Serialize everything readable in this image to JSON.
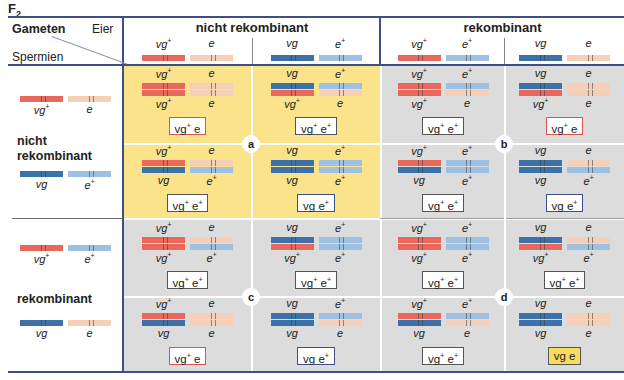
{
  "title": {
    "main": "F",
    "sub": "2"
  },
  "header": {
    "gameten": "Gameten",
    "eier": "Eier",
    "spermien": "Spermien",
    "groups": [
      {
        "label": "nicht rekombinant"
      },
      {
        "label": "rekombinant"
      }
    ],
    "egg_gametes": [
      {
        "a1": {
          "text": "vg",
          "sup": "+",
          "color": "vgp"
        },
        "a2": {
          "text": "e",
          "sup": "",
          "color": "e"
        }
      },
      {
        "a1": {
          "text": "vg",
          "sup": "",
          "color": "vg"
        },
        "a2": {
          "text": "e",
          "sup": "+",
          "color": "ep"
        }
      },
      {
        "a1": {
          "text": "vg",
          "sup": "+",
          "color": "vgp"
        },
        "a2": {
          "text": "e",
          "sup": "+",
          "color": "ep"
        }
      },
      {
        "a1": {
          "text": "vg",
          "sup": "",
          "color": "vg"
        },
        "a2": {
          "text": "e",
          "sup": "",
          "color": "e"
        }
      }
    ]
  },
  "rows": {
    "groups": [
      {
        "label_line1": "nicht",
        "label_line2": "rekombinant"
      },
      {
        "label_line1": "rekombinant",
        "label_line2": ""
      }
    ],
    "sperm_gametes": [
      {
        "a1": {
          "text": "vg",
          "sup": "+",
          "color": "vgp"
        },
        "a2": {
          "text": "e",
          "sup": "",
          "color": "e"
        }
      },
      {
        "a1": {
          "text": "vg",
          "sup": "",
          "color": "vg"
        },
        "a2": {
          "text": "e",
          "sup": "+",
          "color": "ep"
        }
      },
      {
        "a1": {
          "text": "vg",
          "sup": "+",
          "color": "vgp"
        },
        "a2": {
          "text": "e",
          "sup": "+",
          "color": "ep"
        }
      },
      {
        "a1": {
          "text": "vg",
          "sup": "",
          "color": "vg"
        },
        "a2": {
          "text": "e",
          "sup": "",
          "color": "e"
        }
      }
    ]
  },
  "quadrant_labels": [
    "a",
    "b",
    "c",
    "d"
  ],
  "cells": [
    [
      {
        "phenotype": {
          "p1": "vg",
          "s1": "+",
          "p2": "e",
          "s2": ""
        },
        "box": "red"
      },
      {
        "phenotype": {
          "p1": "vg",
          "s1": "+",
          "p2": "e",
          "s2": "+"
        },
        "box": "plain"
      },
      {
        "phenotype": {
          "p1": "vg",
          "s1": "+",
          "p2": "e",
          "s2": "+"
        },
        "box": "plain"
      },
      {
        "phenotype": {
          "p1": "vg",
          "s1": "+",
          "p2": "e",
          "s2": ""
        },
        "box": "red"
      }
    ],
    [
      {
        "phenotype": {
          "p1": "vg",
          "s1": "+",
          "p2": "e",
          "s2": "+"
        },
        "box": "plain"
      },
      {
        "phenotype": {
          "p1": "vg",
          "s1": "",
          "p2": "e",
          "s2": "+"
        },
        "box": "blue"
      },
      {
        "phenotype": {
          "p1": "vg",
          "s1": "+",
          "p2": "e",
          "s2": "+"
        },
        "box": "plain"
      },
      {
        "phenotype": {
          "p1": "vg",
          "s1": "",
          "p2": "e",
          "s2": "+"
        },
        "box": "blue"
      }
    ],
    [
      {
        "phenotype": {
          "p1": "vg",
          "s1": "+",
          "p2": "e",
          "s2": "+"
        },
        "box": "plain"
      },
      {
        "phenotype": {
          "p1": "vg",
          "s1": "+",
          "p2": "e",
          "s2": "+"
        },
        "box": "plain"
      },
      {
        "phenotype": {
          "p1": "vg",
          "s1": "+",
          "p2": "e",
          "s2": "+"
        },
        "box": "plain"
      },
      {
        "phenotype": {
          "p1": "vg",
          "s1": "+",
          "p2": "e",
          "s2": "+"
        },
        "box": "plain"
      }
    ],
    [
      {
        "phenotype": {
          "p1": "vg",
          "s1": "+",
          "p2": "e",
          "s2": ""
        },
        "box": "red"
      },
      {
        "phenotype": {
          "p1": "vg",
          "s1": "",
          "p2": "e",
          "s2": "+"
        },
        "box": "blue"
      },
      {
        "phenotype": {
          "p1": "vg",
          "s1": "+",
          "p2": "e",
          "s2": "+"
        },
        "box": "plain"
      },
      {
        "phenotype": {
          "p1": "vg",
          "s1": "",
          "p2": "e",
          "s2": ""
        },
        "box": "yellowfill"
      }
    ]
  ],
  "colors": {
    "vgp": "#e8695c",
    "vg": "#3d72a8",
    "e": "#f6cfb9",
    "ep": "#9ec1e3",
    "quadrant_yellow": "#fbe38c",
    "quadrant_gray": "#dcdcdc",
    "rule": "#3d4f86"
  }
}
